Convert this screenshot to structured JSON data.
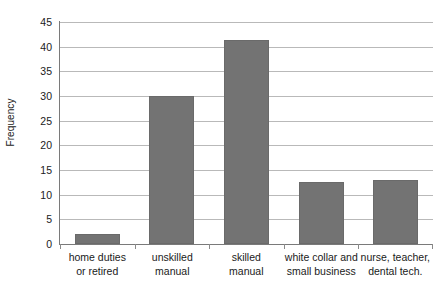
{
  "chart_data": {
    "type": "bar",
    "title": "",
    "xlabel": "",
    "ylabel": "Frequency",
    "ylim": [
      0,
      45
    ],
    "ytick_step": 5,
    "grid": true,
    "legend": "none",
    "bar_color": "#737373",
    "gridline_color": "#b9b9b9",
    "axis_color": "#7a7a7a",
    "categories": [
      "home duties or retired",
      "unskilled manual",
      "skilled manual",
      "white collar and small business",
      "nurse, teacher, dental tech."
    ],
    "category_label_lines": [
      [
        "home duties",
        "or retired"
      ],
      [
        "unskilled",
        "manual"
      ],
      [
        "skilled",
        "manual"
      ],
      [
        "white collar and",
        "small business"
      ],
      [
        "nurse, teacher,",
        "dental tech."
      ]
    ],
    "values": [
      2,
      30,
      41.3,
      12.6,
      13
    ],
    "ytick_labels": [
      "45",
      "40",
      "35",
      "30",
      "25",
      "20",
      "15",
      "10",
      "5",
      "0"
    ],
    "ytick_values": [
      45,
      40,
      35,
      30,
      25,
      20,
      15,
      10,
      5,
      0
    ]
  }
}
